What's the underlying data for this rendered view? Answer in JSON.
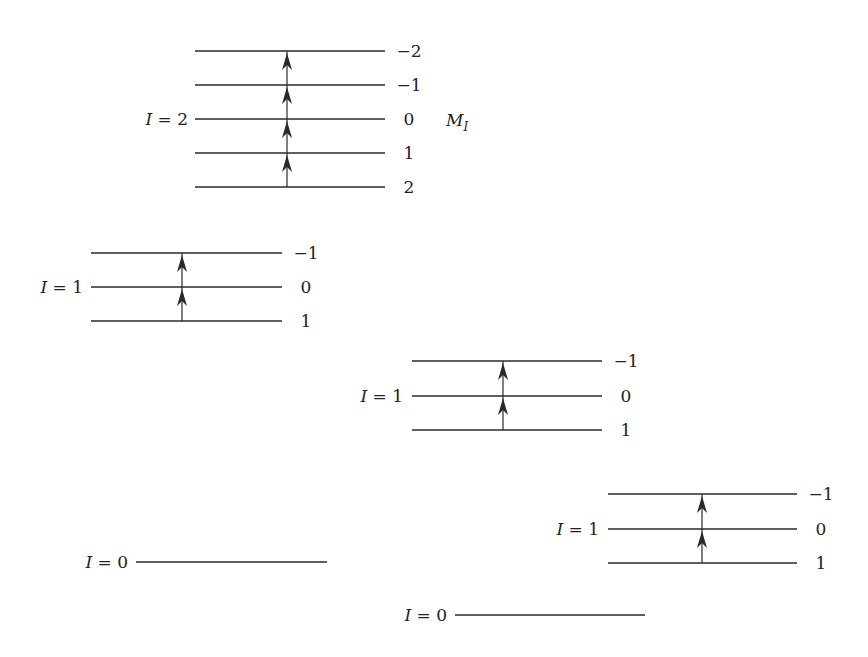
{
  "diagram": {
    "type": "energy-level diagram",
    "axis_label": {
      "text": "M",
      "sub": "I",
      "x": 446,
      "y": 126
    },
    "groups": [
      {
        "id": "g1",
        "label": "I = 2",
        "label_I": "I",
        "label_val": "= 2",
        "label_x": 188,
        "x1": 195,
        "x2": 385,
        "arrow_x": 287,
        "levels": [
          {
            "y": 51,
            "mi": "−2"
          },
          {
            "y": 85,
            "mi": "−1"
          },
          {
            "y": 119,
            "mi": "0"
          },
          {
            "y": 153,
            "mi": "1"
          },
          {
            "y": 187,
            "mi": "2"
          }
        ]
      },
      {
        "id": "g2",
        "label": "I = 1",
        "label_I": "I",
        "label_val": "= 1",
        "label_x": 83,
        "x1": 91,
        "x2": 282,
        "arrow_x": 182,
        "levels": [
          {
            "y": 253,
            "mi": "−1"
          },
          {
            "y": 287,
            "mi": "0"
          },
          {
            "y": 321,
            "mi": "1"
          }
        ]
      },
      {
        "id": "g3",
        "label": "I = 1",
        "label_I": "I",
        "label_val": "= 1",
        "label_x": 403,
        "x1": 412,
        "x2": 602,
        "arrow_x": 503,
        "levels": [
          {
            "y": 361,
            "mi": "−1"
          },
          {
            "y": 396,
            "mi": "0"
          },
          {
            "y": 430,
            "mi": "1"
          }
        ]
      },
      {
        "id": "g4",
        "label": "I = 1",
        "label_I": "I",
        "label_val": "= 1",
        "label_x": 599,
        "x1": 608,
        "x2": 797,
        "arrow_x": 702,
        "levels": [
          {
            "y": 494,
            "mi": "−1"
          },
          {
            "y": 529,
            "mi": "0"
          },
          {
            "y": 563,
            "mi": "1"
          }
        ]
      },
      {
        "id": "g5",
        "label": "I = 0",
        "label_I": "I",
        "label_val": "= 0",
        "label_x": 128,
        "x1": 136,
        "x2": 327,
        "arrow_x": null,
        "levels": [
          {
            "y": 562,
            "mi": ""
          }
        ]
      },
      {
        "id": "g6",
        "label": "I = 0",
        "label_I": "I",
        "label_val": "= 0",
        "label_x": 447,
        "x1": 455,
        "x2": 645,
        "arrow_x": null,
        "levels": [
          {
            "y": 615,
            "mi": ""
          }
        ]
      }
    ]
  }
}
